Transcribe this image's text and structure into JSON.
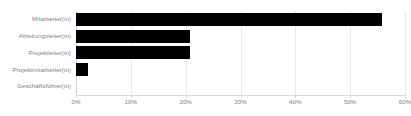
{
  "chart_data": {
    "type": "bar",
    "orientation": "horizontal",
    "title": "",
    "subtitle": "",
    "xlabel": "",
    "ylabel": "",
    "categories": [
      "Mitarbeiter(in)",
      "Abteilungsleiter(in)",
      "Projektleiter(in)",
      "Projektmitarbeiter(in)",
      "Geschäftsführer(in)"
    ],
    "values": [
      55.8,
      20.7,
      20.7,
      2.1,
      0
    ],
    "value_unit": "%",
    "xlim": [
      0,
      60
    ],
    "xticks": [
      0,
      10,
      20,
      30,
      40,
      50,
      60
    ],
    "xtick_labels": [
      "0%",
      "10%",
      "20%",
      "30%",
      "40%",
      "50%",
      "60%"
    ],
    "grid": true,
    "grid_axis": "x",
    "legend": false,
    "legend_position": "none",
    "series": [
      {
        "name": "Anteil",
        "values": [
          55.8,
          20.7,
          20.7,
          2.1,
          0
        ]
      }
    ],
    "colors": {
      "bar": "#000000",
      "grid": "#e8e8e8",
      "axis": "#d9d9d9",
      "tick_label": "#7f7f7f",
      "category_label": "#7f7f7f",
      "background": "#ffffff"
    }
  }
}
